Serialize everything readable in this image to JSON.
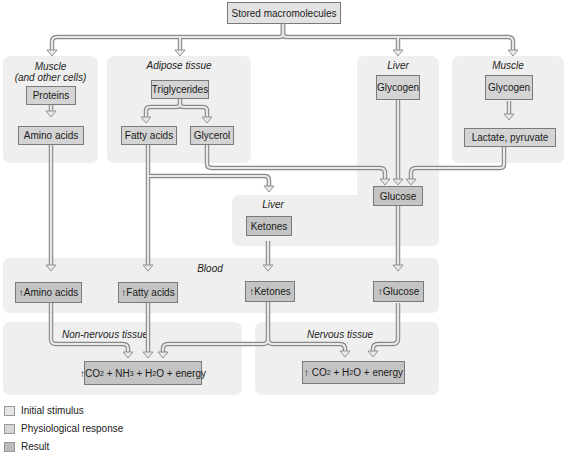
{
  "title": "Stored macromolecules",
  "regions": {
    "muscle_other": {
      "label_line1": "Muscle",
      "label_line2": "(and other cells)"
    },
    "adipose": {
      "label": "Adipose tissue"
    },
    "liver_top": {
      "label": "Liver"
    },
    "muscle_right": {
      "label": "Muscle"
    },
    "liver_ketones": {
      "label": "Liver"
    },
    "blood": {
      "label": "Blood"
    },
    "non_nervous": {
      "label": "Non-nervous tissue"
    },
    "nervous": {
      "label": "Nervous tissue"
    }
  },
  "boxes": {
    "proteins": "Proteins",
    "amino_acids": "Amino acids",
    "triglycerides": "Triglycerides",
    "fatty_acids": "Fatty acids",
    "glycerol": "Glycerol",
    "liver_glycogen": "Glycogen",
    "muscle_glycogen": "Glycogen",
    "lactate_pyruvate": "Lactate, pyruvate",
    "glucose": "Glucose",
    "ketones": "Ketones",
    "blood_amino_acids": "↑Amino acids",
    "blood_fatty_acids": "↑Fatty acids",
    "blood_ketones": "↑Ketones",
    "blood_glucose": "↑Glucose",
    "non_nervous_result": {
      "arrow": "↑",
      "t1": "CO",
      "s1": "2",
      "t2": " + NH",
      "s2": "3",
      "t3": " + H",
      "s3": "2",
      "t4": "O + energy"
    },
    "nervous_result": {
      "arrow": "↑",
      "t1": " CO",
      "s1": "2",
      "t2": " + H",
      "s2": "2",
      "t3": "O + energy"
    }
  },
  "legend": [
    {
      "label": "Initial stimulus",
      "color": "#e6e6e6"
    },
    {
      "label": "Physiological response",
      "color": "#d6d6d6"
    },
    {
      "label": "Result",
      "color": "#bdbdbd"
    }
  ],
  "colors": {
    "region_bg": "#efefef",
    "arrow_fill": "#e8e8e8",
    "arrow_stroke": "#8a8a8a"
  }
}
